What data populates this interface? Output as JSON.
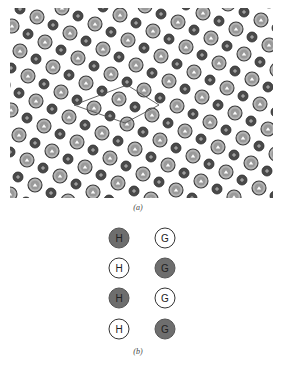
{
  "figure_a": {
    "caption": "(a)",
    "caption_pos": [
      138,
      208
    ],
    "lattice": {
      "origin": [
        37,
        17
      ],
      "basis_a": [
        33,
        16
      ],
      "basis_b": [
        8,
        25
      ],
      "small_offset": [
        16,
        8
      ],
      "clip": {
        "x_min": 10,
        "x_max": 273,
        "y_min": 8,
        "y_max": 198
      },
      "large_radius": 7,
      "small_radius": 5,
      "large_fill": "#b4b4b4",
      "large_stroke": "#3a3a3a",
      "large_inner": "#9a9a9a",
      "large_mark": "#ffffff",
      "small_fill": "#4a4a4a",
      "small_stroke": "#2a2a2a",
      "small_mark": "#d0d0d0",
      "large_icon": "triangle-mark",
      "small_icon": "plus-mark"
    },
    "unit_cell": {
      "vertices": [
        [
          74,
          105
        ],
        [
          127,
          85
        ],
        [
          159,
          105
        ],
        [
          125,
          123
        ]
      ],
      "stroke": "#555555"
    }
  },
  "figure_b": {
    "caption": "(b)",
    "caption_pos": [
      138,
      132
    ],
    "columns": [
      {
        "label": "H",
        "x": 119,
        "cells": [
          "filled",
          "empty",
          "filled",
          "empty"
        ]
      },
      {
        "label": "G",
        "x": 165,
        "cells": [
          "empty",
          "filled",
          "empty",
          "filled"
        ]
      }
    ],
    "row_y": [
      18,
      48,
      78,
      109
    ]
  }
}
